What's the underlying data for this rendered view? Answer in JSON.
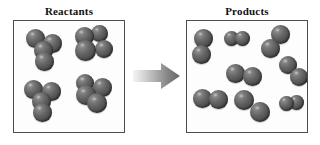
{
  "figure": {
    "type": "chemical-reaction-diagram",
    "background_color": "#ffffff"
  },
  "labels": {
    "reactants": "Reactants",
    "products": "Products"
  },
  "style": {
    "atom_color": "#5a5a5a",
    "atom_highlight_color": "#9a9a9a",
    "atom_shadow_color": "#343434",
    "panel_border_color": "#4d4d4d",
    "panel_fill_color": "#fdfdfd",
    "arrow_color_start": "#f2f2f2",
    "arrow_color_end": "#6e6e6e",
    "label_color": "#111111"
  },
  "arrow": {
    "name": "reaction-arrow",
    "direction": "right",
    "glyph": "block-arrow"
  },
  "reactants_panel": {
    "title": "Reactants",
    "molecule_count": 4,
    "atoms_per_molecule": 4,
    "total_atoms": 16,
    "molecules": [
      {
        "id": "r1",
        "label": "reactant-molecule-1",
        "x": 10,
        "y": 8,
        "atoms": [
          {
            "cx": 11,
            "cy": 9,
            "r": 9.5
          },
          {
            "cx": 28,
            "cy": 14,
            "r": 9.5
          },
          {
            "cx": 19,
            "cy": 21,
            "r": 9.5
          },
          {
            "cx": 20,
            "cy": 32,
            "r": 9.5
          }
        ]
      },
      {
        "id": "r2",
        "label": "reactant-molecule-2",
        "x": 56,
        "y": 6,
        "atoms": [
          {
            "cx": 14,
            "cy": 9,
            "r": 9.5
          },
          {
            "cx": 29,
            "cy": 6,
            "r": 8.5
          },
          {
            "cx": 15,
            "cy": 23,
            "r": 10.5
          },
          {
            "cx": 34,
            "cy": 22,
            "r": 9.0
          }
        ]
      },
      {
        "id": "r3",
        "label": "reactant-molecule-3",
        "x": 8,
        "y": 58,
        "atoms": [
          {
            "cx": 11,
            "cy": 10,
            "r": 9.5
          },
          {
            "cx": 29,
            "cy": 12,
            "r": 9.5
          },
          {
            "cx": 19,
            "cy": 22,
            "r": 9.5
          },
          {
            "cx": 20,
            "cy": 33,
            "r": 9.5
          }
        ]
      },
      {
        "id": "r4",
        "label": "reactant-molecule-4",
        "x": 55,
        "y": 54,
        "atoms": [
          {
            "cx": 16,
            "cy": 8,
            "r": 9.0
          },
          {
            "cx": 33,
            "cy": 12,
            "r": 9.5
          },
          {
            "cx": 17,
            "cy": 20,
            "r": 10.0
          },
          {
            "cx": 28,
            "cy": 28,
            "r": 10.0
          }
        ]
      }
    ]
  },
  "products_panel": {
    "title": "Products",
    "molecule_count": 8,
    "atoms_per_molecule": 2,
    "total_atoms": 16,
    "molecules": [
      {
        "id": "p1",
        "label": "product-molecule-1",
        "x": 4,
        "y": 8,
        "orientation": "vertical",
        "atoms": [
          {
            "cx": 12,
            "cy": 9,
            "r": 9.5
          },
          {
            "cx": 10,
            "cy": 25,
            "r": 9.5
          }
        ]
      },
      {
        "id": "p2",
        "label": "product-molecule-2",
        "x": 36,
        "y": 8,
        "orientation": "horizontal",
        "atoms": [
          {
            "cx": 8,
            "cy": 9,
            "r": 7.5
          },
          {
            "cx": 19,
            "cy": 9,
            "r": 7.5
          }
        ]
      },
      {
        "id": "p3",
        "label": "product-molecule-3",
        "x": 74,
        "y": 5,
        "orientation": "diagonal",
        "atoms": [
          {
            "cx": 19,
            "cy": 8,
            "r": 9.5
          },
          {
            "cx": 9,
            "cy": 22,
            "r": 9.5
          }
        ]
      },
      {
        "id": "p4",
        "label": "product-molecule-4",
        "x": 92,
        "y": 36,
        "orientation": "diagonal",
        "atoms": [
          {
            "cx": 9,
            "cy": 8,
            "r": 9.0
          },
          {
            "cx": 20,
            "cy": 20,
            "r": 9.0
          }
        ]
      },
      {
        "id": "p5",
        "label": "product-molecule-5",
        "x": 38,
        "y": 42,
        "orientation": "horizontal",
        "atoms": [
          {
            "cx": 10,
            "cy": 10,
            "r": 9.5
          },
          {
            "cx": 27,
            "cy": 13,
            "r": 9.5
          }
        ]
      },
      {
        "id": "p6",
        "label": "product-molecule-6",
        "x": 4,
        "y": 66,
        "orientation": "horizontal",
        "atoms": [
          {
            "cx": 11,
            "cy": 11,
            "r": 9.5
          },
          {
            "cx": 27,
            "cy": 12,
            "r": 9.5
          }
        ]
      },
      {
        "id": "p7",
        "label": "product-molecule-7",
        "x": 46,
        "y": 70,
        "orientation": "diagonal",
        "atoms": [
          {
            "cx": 11,
            "cy": 9,
            "r": 10.0
          },
          {
            "cx": 27,
            "cy": 21,
            "r": 10.0
          }
        ]
      },
      {
        "id": "p8",
        "label": "product-molecule-8",
        "x": 90,
        "y": 72,
        "orientation": "horizontal",
        "atoms": [
          {
            "cx": 9,
            "cy": 10,
            "r": 7.5
          },
          {
            "cx": 19,
            "cy": 9,
            "r": 7.5
          }
        ]
      }
    ]
  }
}
